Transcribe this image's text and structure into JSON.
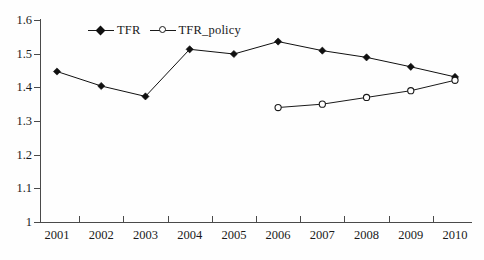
{
  "chart_data": {
    "type": "line",
    "title": "",
    "subtitle": "",
    "xlabel": "",
    "ylabel": "",
    "categories": [
      "2001",
      "2002",
      "2003",
      "2004",
      "2005",
      "2006",
      "2007",
      "2008",
      "2009",
      "2010"
    ],
    "x": [
      2001,
      2002,
      2003,
      2004,
      2005,
      2006,
      2007,
      2008,
      2009,
      2010
    ],
    "xlim": [
      2000.5,
      2010.9
    ],
    "ylim": [
      1.0,
      1.6
    ],
    "ytick_labels": [
      "1",
      "1.1",
      "1.2",
      "1.3",
      "1.4",
      "1.5",
      "1.6"
    ],
    "ytick_values": [
      1.0,
      1.1,
      1.2,
      1.3,
      1.4,
      1.5,
      1.6
    ],
    "grid": false,
    "legend_position": "top-center",
    "series": [
      {
        "name": "TFR",
        "marker": "filled-diamond",
        "color": "#101010",
        "values": [
          1.447,
          1.404,
          1.373,
          1.513,
          1.499,
          1.536,
          1.509,
          1.489,
          1.461,
          1.431
        ]
      },
      {
        "name": "TFR_policy",
        "marker": "open-circle",
        "color": "#1a1a1a",
        "values": [
          null,
          null,
          null,
          null,
          null,
          1.34,
          1.35,
          1.37,
          1.39,
          1.421
        ]
      }
    ]
  },
  "legend": {
    "entries": [
      {
        "label": "TFR",
        "marker": "filled-diamond-icon"
      },
      {
        "label": "TFR_policy",
        "marker": "open-circle-icon"
      }
    ]
  },
  "axes": {
    "y_labels": [
      "1.6",
      "1.5",
      "1.4",
      "1.3",
      "1.2",
      "1.1",
      "1"
    ],
    "x_labels": [
      "2001",
      "2002",
      "2003",
      "2004",
      "2005",
      "2006",
      "2007",
      "2008",
      "2009",
      "2010"
    ]
  },
  "colors": {
    "axis": "#4a4a4a",
    "text": "#1a1a1a",
    "series_tfr": "#101010",
    "series_tfr_policy": "#1a1a1a",
    "background": "#fefefe"
  }
}
